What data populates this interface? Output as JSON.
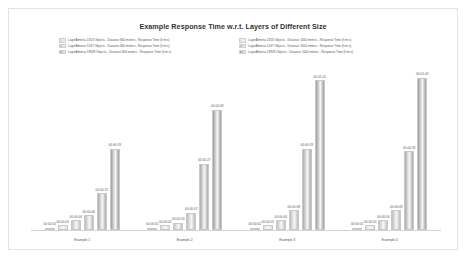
{
  "chart": {
    "title": "Example Response Time w.r.t. Layers of Different Size",
    "legend": {
      "left": [
        {
          "label": "LayerAlmeria 1353 Objects - Distance 800 meters - Response Time (h:m:s)",
          "color": "#d9d9d9"
        },
        {
          "label": "LayerAlmeria 5247 Objects - Distance 800 meters - Response Time (h:m:s)",
          "color": "#c4c4c4"
        },
        {
          "label": "LayerAlmeria 19929 Objects - Distance 800 meters - Response Time (h:m:s)",
          "color": "#ababab"
        }
      ],
      "right": [
        {
          "label": "LayerAlmeria 1353 Objects - Distance 1000 meters - Response Time (h:m:s)",
          "color": "#e0e0e0"
        },
        {
          "label": "LayerAlmeria 5247 Objects - Distance 1000 meters - Response Time (h:m:s)",
          "color": "#bdbdbd"
        },
        {
          "label": "LayerAlmeria 19929 Objects - Distance 1000 meters - Response Time (h:m:s)",
          "color": "#9e9e9e"
        }
      ]
    }
  },
  "chart_data": {
    "type": "bar",
    "title": "Example Response Time w.r.t. Layers of Different Size",
    "xlabel": "",
    "ylabel": "Response Time (h:m:s)",
    "grid": false,
    "legend_position": "top",
    "categories": [
      "Example 1",
      "Example 2",
      "Example 3",
      "Example 4"
    ],
    "series": [
      {
        "name": "LayerAlmeria 1353 Objects - Distance 800 meters - Response Time (h:m:s)",
        "color": "#d9d9d9",
        "labels": [
          "00:00:01",
          "00:00:01",
          "00:00:01",
          "00:00:01"
        ],
        "values": [
          1,
          1,
          1,
          1
        ]
      },
      {
        "name": "LayerAlmeria 1353 Objects - Distance 1000 meters - Response Time (h:m:s)",
        "color": "#e0e0e0",
        "labels": [
          "00:00:02",
          "00:00:02",
          "00:00:02",
          "00:00:02"
        ],
        "values": [
          2,
          2,
          2,
          2
        ]
      },
      {
        "name": "LayerAlmeria 5247 Objects - Distance 800 meters - Response Time (h:m:s)",
        "color": "#c4c4c4",
        "labels": [
          "00:00:04",
          "00:00:03",
          "00:00:04",
          "00:00:04"
        ],
        "values": [
          4,
          3,
          4,
          4
        ]
      },
      {
        "name": "LayerAlmeria 5247 Objects - Distance 1000 meters - Response Time (h:m:s)",
        "color": "#bdbdbd",
        "labels": [
          "00:00:06",
          "00:00:07",
          "00:00:08",
          "00:00:08"
        ],
        "values": [
          6,
          7,
          8,
          8
        ]
      },
      {
        "name": "LayerAlmeria 19929 Objects - Distance 800 meters - Response Time (h:m:s)",
        "color": "#ababab",
        "labels": [
          "00:00:15",
          "00:00:27",
          "00:00:33",
          "00:00:32"
        ],
        "values": [
          15,
          27,
          33,
          32
        ]
      },
      {
        "name": "LayerAlmeria 19929 Objects - Distance 1000 meters - Response Time (h:m:s)",
        "color": "#9e9e9e",
        "labels": [
          "00:00:33",
          "00:00:49",
          "00:01:01",
          "00:01:02"
        ],
        "values": [
          33,
          49,
          61,
          62
        ]
      }
    ],
    "ylim": [
      0,
      68
    ]
  }
}
